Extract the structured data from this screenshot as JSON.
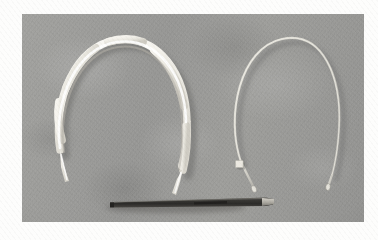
{
  "image": {
    "kind": "photograph",
    "palette": "grayscale",
    "width_px": 378,
    "height_px": 240,
    "page_background": "#fdfdfc",
    "plate": {
      "left_px": 22,
      "top_px": 14,
      "width_px": 342,
      "height_px": 208,
      "background_color": "#9a9a98",
      "surface_description": "flat mottled mid-grey board"
    },
    "caption": "",
    "watermark": ""
  },
  "objects": [
    {
      "id": "left-headband",
      "label": "white twisted fabric headband",
      "color": "#f1efe9",
      "shadow_color": "#6f6f6d",
      "position": "left half of the plate",
      "form": "open horseshoe arch with wavy twisted texture, two tapered tips pointing down",
      "tip_count": 2
    },
    {
      "id": "right-headband",
      "label": "thin metal wire headband",
      "color": "#d9d7cf",
      "shadow_color": "#6a6a68",
      "position": "right half of the plate",
      "form": "open narrow horseshoe of fine round wire, two small bulbed end caps",
      "tip_count": 2
    },
    {
      "id": "size-tag",
      "label": "small white square tag",
      "color": "#ece9e1",
      "position": "inner left side of the wire headband, near its lower end"
    },
    {
      "id": "scale-pen",
      "label": "dark pen used as a scale reference",
      "color": "#3b3a38",
      "highlight_color": "#b9b7b0",
      "position": "lower centre of the plate, lying horizontally",
      "orientation": "horizontal, light-coloured tip at the right end"
    }
  ]
}
